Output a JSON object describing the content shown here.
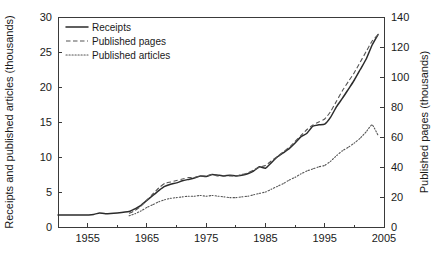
{
  "chart_data": {
    "type": "line",
    "title": "",
    "xlabel": "",
    "ylabel": "Receipts and published articles (thousands)",
    "y2label": "Published pages (thousands)",
    "xlim": [
      1950,
      2005
    ],
    "ylim": [
      0,
      30
    ],
    "y2lim": [
      0,
      140
    ],
    "grid": false,
    "legend_position": "top-left",
    "x_ticklabels": [
      "1955",
      "1965",
      "1975",
      "1985",
      "1995",
      "2005"
    ],
    "x_tickvalues": [
      1955,
      1965,
      1975,
      1985,
      1995,
      2005
    ],
    "x_minor_tickvalues": [
      1950,
      1960,
      1970,
      1980,
      1990,
      2000
    ],
    "y_ticklabels": [
      "0",
      "5",
      "10",
      "15",
      "20",
      "25",
      "30"
    ],
    "y_tickvalues": [
      0,
      5,
      10,
      15,
      20,
      25,
      30
    ],
    "y2_ticklabels": [
      "0",
      "20",
      "40",
      "60",
      "80",
      "100",
      "120",
      "140"
    ],
    "y2_tickvalues": [
      0,
      20,
      40,
      60,
      80,
      100,
      120,
      140
    ],
    "series": [
      {
        "name": "Receipts",
        "style": "solid",
        "axis": "left",
        "units": "thousands",
        "x": [
          1950,
          1952,
          1954,
          1956,
          1957,
          1958,
          1960,
          1962,
          1963,
          1964,
          1965,
          1966,
          1967,
          1968,
          1969,
          1970,
          1971,
          1972,
          1973,
          1974,
          1975,
          1976,
          1977,
          1978,
          1979,
          1980,
          1981,
          1982,
          1983,
          1984,
          1985,
          1986,
          1987,
          1988,
          1989,
          1990,
          1991,
          1992,
          1993,
          1994,
          1995,
          1996,
          1997,
          1998,
          1999,
          2000,
          2001,
          2002,
          2003,
          2004
        ],
        "values": [
          1.7,
          1.7,
          1.7,
          1.8,
          2.0,
          1.9,
          2.0,
          2.2,
          2.6,
          3.1,
          3.8,
          4.5,
          5.2,
          5.8,
          6.1,
          6.3,
          6.6,
          6.8,
          7.0,
          7.3,
          7.2,
          7.5,
          7.4,
          7.3,
          7.4,
          7.3,
          7.4,
          7.6,
          8.0,
          8.6,
          8.4,
          9.2,
          10.0,
          10.6,
          11.2,
          12.0,
          12.9,
          13.4,
          14.4,
          14.6,
          14.7,
          15.7,
          17.2,
          18.4,
          19.7,
          21.0,
          22.5,
          24.0,
          26.0,
          27.5
        ]
      },
      {
        "name": "Published pages",
        "style": "dashed",
        "axis": "right",
        "units": "thousands",
        "x": [
          1962,
          1963,
          1964,
          1965,
          1966,
          1967,
          1968,
          1969,
          1970,
          1971,
          1972,
          1973,
          1974,
          1975,
          1976,
          1977,
          1978,
          1979,
          1980,
          1981,
          1982,
          1983,
          1984,
          1985,
          1986,
          1987,
          1988,
          1989,
          1990,
          1991,
          1992,
          1993,
          1994,
          1995,
          1996,
          1997,
          1998,
          1999,
          2000,
          2001,
          2002,
          2003,
          2004
        ],
        "values": [
          9,
          11,
          14,
          18,
          22,
          26,
          29,
          30,
          31,
          32,
          33,
          33,
          34,
          34,
          35,
          34,
          34,
          34,
          34,
          35,
          36,
          38,
          40,
          41,
          44,
          47,
          50,
          53,
          57,
          61,
          65,
          68,
          70,
          72,
          77,
          84,
          91,
          97,
          103,
          110,
          117,
          124,
          128
        ]
      },
      {
        "name": "Published articles",
        "style": "dotted",
        "axis": "left",
        "units": "thousands",
        "x": [
          1962,
          1963,
          1964,
          1965,
          1966,
          1967,
          1968,
          1969,
          1970,
          1971,
          1972,
          1973,
          1974,
          1975,
          1976,
          1977,
          1978,
          1979,
          1980,
          1981,
          1982,
          1983,
          1984,
          1985,
          1986,
          1987,
          1988,
          1989,
          1990,
          1991,
          1992,
          1993,
          1994,
          1995,
          1996,
          1997,
          1998,
          1999,
          2000,
          2001,
          2002,
          2003,
          2004
        ],
        "values": [
          1.6,
          1.9,
          2.3,
          2.8,
          3.2,
          3.6,
          3.9,
          4.1,
          4.2,
          4.3,
          4.4,
          4.4,
          4.5,
          4.4,
          4.5,
          4.4,
          4.3,
          4.2,
          4.2,
          4.3,
          4.4,
          4.6,
          4.8,
          5.0,
          5.4,
          5.8,
          6.2,
          6.7,
          7.1,
          7.6,
          8.0,
          8.3,
          8.6,
          8.8,
          9.4,
          10.2,
          10.9,
          11.4,
          12.0,
          12.7,
          13.6,
          14.6,
          13.1
        ]
      }
    ],
    "colors": {
      "receipts": "#2b2b2b",
      "published_pages": "#555555",
      "published_articles": "#555555",
      "axis": "#3a3a3a",
      "background": "#ffffff"
    }
  },
  "legend": {
    "items": [
      {
        "label": "Receipts",
        "style": "solid"
      },
      {
        "label": "Published pages",
        "style": "dashed"
      },
      {
        "label": "Published articles",
        "style": "dotted"
      }
    ]
  }
}
